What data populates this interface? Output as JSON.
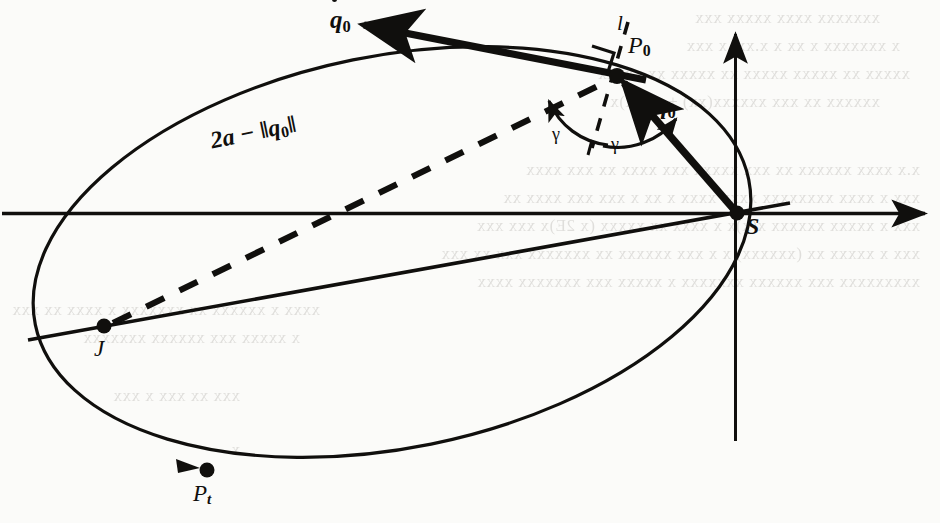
{
  "figure": {
    "kind": "orbital-mechanics-diagram",
    "background_color": "#fbfbf9",
    "ink_color": "#100f0d",
    "labels": {
      "velocity_vector": "q",
      "velocity_vector_sub": "0",
      "position_vector": "q",
      "position_vector_sub": "0",
      "point_P0": "P",
      "point_P0_sub": "0",
      "point_S": "S",
      "point_J": "J",
      "point_Pt": "P",
      "point_Pt_sub": "t",
      "line_l": "l",
      "gamma_left": "γ",
      "gamma_right": "γ",
      "chord_expression": "2a − ‖q",
      "chord_expression_sub": "0",
      "chord_expression_tail": "‖"
    },
    "geometry": {
      "ellipse_center_x": 392,
      "ellipse_center_y": 252,
      "ellipse_rx": 364,
      "ellipse_ry": 196,
      "ellipse_rotation_deg": -11.5,
      "focus_S_x": 737,
      "focus_S_y": 213,
      "vacant_focus_J_x": 103,
      "vacant_focus_J_y": 327,
      "point_P0_x": 616,
      "point_P0_y": 75,
      "point_Pt_x": 206,
      "point_Pt_y": 470,
      "horizontal_axis_y": 213,
      "horizontal_axis_x1": 2,
      "horizontal_axis_x2": 931,
      "vertical_axis_x": 735,
      "vertical_axis_y1": 26,
      "vertical_axis_y2": 441,
      "qdot_tip_x": 352,
      "qdot_tip_y": 22,
      "qdot_tail_x": 640,
      "qdot_tail_y": 78
    },
    "ghost_text": {
      "note": "faint show-through text from the reverse page",
      "lines": [
        {
          "x": 60,
          "y": 8,
          "text": "xxxxxxx xxxx xxxxx xxx"
        },
        {
          "x": 40,
          "y": 36,
          "text": "x xxxxxxx  x  xx   x  x.xx,   x  xxx"
        },
        {
          "x": 30,
          "y": 64,
          "text": "xxxxx xx xxxxx xxxxx xx xxxxx xx xxxxx"
        },
        {
          "x": 60,
          "y": 92,
          "text": "xxxxxx xx xxx xxxxxx(xx) + x(x,x)x"
        },
        {
          "x": 20,
          "y": 160,
          "text": "x.x xxxx xxxxxx xx xxx xxxxx xxx xxxx xx xxx xxxx"
        },
        {
          "x": 20,
          "y": 188,
          "text": "xxx x xxxx xxxxxxxx xxxx xxxx x xx x xxx xxx xxxx xx"
        },
        {
          "x": 20,
          "y": 216,
          "text": "xxx x xxxxx xxxxxx x(x)x x   xxxx xx xxxxx (x 2E)x xxx xxx"
        },
        {
          "x": 20,
          "y": 244,
          "text": "xxx x xxxxx xx (xxxxxx) x x xxx xxxxxx xx xxxxxxx xxx xx xxx"
        },
        {
          "x": 20,
          "y": 272,
          "text": "xxxxxxxxx xxx xxxxxx xxxxxxx x xxxxx  xxx xxxxxxx xxxx"
        },
        {
          "x": 620,
          "y": 300,
          "text": "xxxx x xxxxxx xx xxxxxxx x xxxx xx xxx"
        },
        {
          "x": 640,
          "y": 328,
          "text": "x xxxxx xxx xxxxxx xxxxxxx"
        },
        {
          "x": 700,
          "y": 386,
          "text": "xxx xx xxx x xxx"
        },
        {
          "x": 700,
          "y": 440,
          "text": "x"
        }
      ]
    }
  }
}
